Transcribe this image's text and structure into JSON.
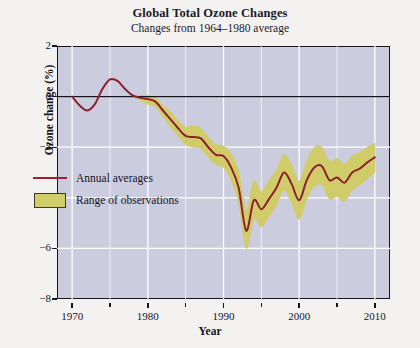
{
  "chart_data": {
    "type": "line",
    "title": "Global Total Ozone Changes",
    "subtitle": "Changes from 1964–1980 average",
    "xlabel": "Year",
    "ylabel": "Ozone change (%)",
    "xlim": [
      1968,
      2012
    ],
    "ylim": [
      -8,
      2
    ],
    "xticks": [
      1970,
      1980,
      1990,
      2000,
      2010
    ],
    "xtick_labels": [
      "1970",
      "1980",
      "1990",
      "2000",
      "2010"
    ],
    "xminor_ticks": [
      1975,
      1985,
      1995,
      2005
    ],
    "yticks": [
      2,
      0,
      -2,
      -4,
      -6,
      -8
    ],
    "ytick_labels": [
      "2",
      "0",
      "−2",
      "−4",
      "−6",
      "−8"
    ],
    "grid": true,
    "grid_color": "#ffffff",
    "plot_background": "#ccccdf",
    "zero_line": true,
    "legend_position": "lower-left",
    "series": [
      {
        "name": "Annual averages",
        "type": "line",
        "color": "#8f1f2e",
        "x": [
          1970,
          1971,
          1972,
          1973,
          1974,
          1975,
          1976,
          1977,
          1978,
          1979,
          1980,
          1981,
          1982,
          1983,
          1984,
          1985,
          1986,
          1987,
          1988,
          1989,
          1990,
          1991,
          1992,
          1993,
          1994,
          1995,
          1996,
          1997,
          1998,
          1999,
          2000,
          2001,
          2002,
          2003,
          2004,
          2005,
          2006,
          2007,
          2008,
          2009,
          2010
        ],
        "values": [
          0.0,
          -0.35,
          -0.55,
          -0.3,
          0.3,
          0.68,
          0.62,
          0.3,
          0.05,
          -0.05,
          -0.1,
          -0.2,
          -0.55,
          -0.9,
          -1.25,
          -1.55,
          -1.6,
          -1.65,
          -2.0,
          -2.3,
          -2.35,
          -2.8,
          -3.6,
          -5.3,
          -4.1,
          -4.45,
          -4.05,
          -3.6,
          -3.0,
          -3.45,
          -4.1,
          -3.3,
          -2.8,
          -2.75,
          -3.3,
          -3.2,
          -3.4,
          -3.0,
          -2.85,
          -2.6,
          -2.4
        ]
      },
      {
        "name": "Range of observations",
        "type": "band",
        "color": "#cfcc69",
        "x": [
          1970,
          1971,
          1972,
          1973,
          1974,
          1975,
          1976,
          1977,
          1978,
          1979,
          1980,
          1981,
          1982,
          1983,
          1984,
          1985,
          1986,
          1987,
          1988,
          1989,
          1990,
          1991,
          1992,
          1993,
          1994,
          1995,
          1996,
          1997,
          1998,
          1999,
          2000,
          2001,
          2002,
          2003,
          2004,
          2005,
          2006,
          2007,
          2008,
          2009,
          2010
        ],
        "upper": [
          0.0,
          -0.35,
          -0.55,
          -0.3,
          0.3,
          0.68,
          0.62,
          0.3,
          0.05,
          0.05,
          0.05,
          -0.05,
          -0.35,
          -0.6,
          -0.95,
          -1.2,
          -1.15,
          -1.25,
          -1.6,
          -1.9,
          -1.95,
          -2.25,
          -2.95,
          -4.5,
          -3.35,
          -3.75,
          -3.3,
          -2.9,
          -2.3,
          -2.7,
          -3.35,
          -2.55,
          -2.0,
          -2.0,
          -2.55,
          -2.45,
          -2.65,
          -2.35,
          -2.2,
          -2.0,
          -1.85
        ],
        "lower": [
          0.0,
          -0.35,
          -0.55,
          -0.3,
          0.3,
          0.68,
          0.62,
          0.3,
          0.05,
          -0.15,
          -0.3,
          -0.4,
          -0.8,
          -1.2,
          -1.55,
          -1.9,
          -2.0,
          -2.05,
          -2.4,
          -2.7,
          -2.8,
          -3.3,
          -4.2,
          -6.0,
          -4.85,
          -5.15,
          -4.75,
          -4.3,
          -3.7,
          -4.2,
          -4.85,
          -4.05,
          -3.55,
          -3.5,
          -4.05,
          -3.95,
          -4.15,
          -3.7,
          -3.5,
          -3.25,
          -3.0
        ]
      }
    ]
  },
  "legend": {
    "items": [
      {
        "label": "Annual averages",
        "key": "line"
      },
      {
        "label": "Range of observations",
        "key": "swatch"
      }
    ]
  }
}
